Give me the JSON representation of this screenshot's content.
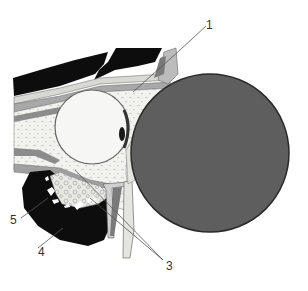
{
  "figure": {
    "type": "anatomical sagittal section diagram",
    "colors": {
      "background": "#ffffff",
      "large_mass": "#5e5e5e",
      "large_mass_outline": "#2a2a2a",
      "dark_regions": "#0d0d0d",
      "fat_tissue": "#f2f2ee",
      "eyeball": "#f6f6f4",
      "muscle": "#8c8c8c",
      "leader_lines": "#555555",
      "label_text": "#333333"
    },
    "labels": [
      {
        "id": "1",
        "text": "1",
        "x": 208,
        "y": 19
      },
      {
        "id": "3",
        "text": "3",
        "x": 167,
        "y": 260
      },
      {
        "id": "4",
        "text": "4",
        "x": 39,
        "y": 246
      },
      {
        "id": "5",
        "text": "5",
        "x": 11,
        "y": 215
      }
    ]
  }
}
